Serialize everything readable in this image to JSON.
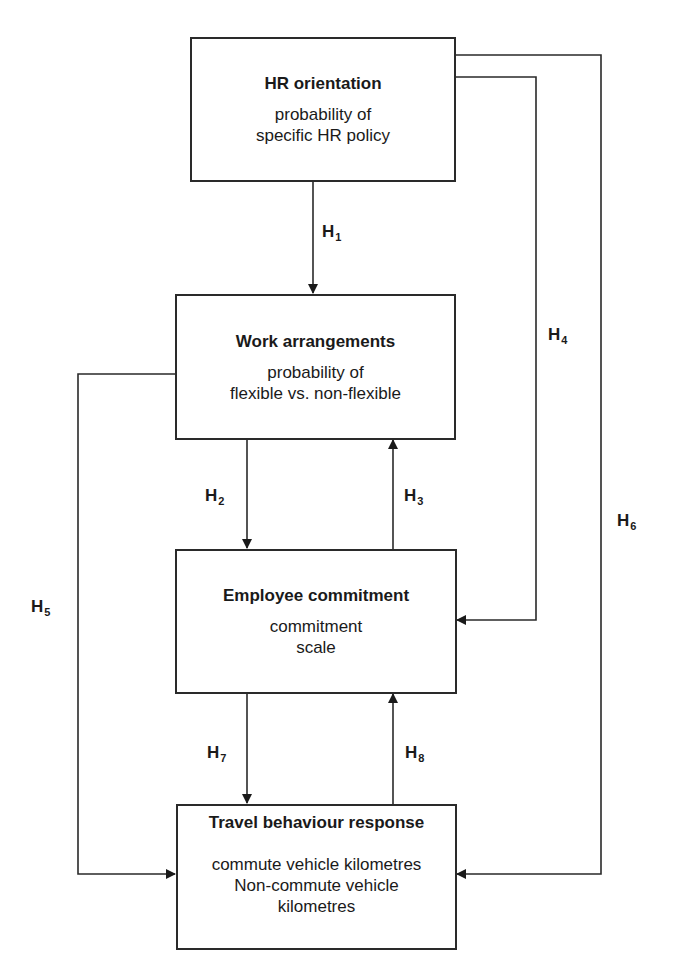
{
  "diagram": {
    "type": "flow-diagram",
    "line_color": "#2a2a2a",
    "boxes": [
      {
        "id": "hr",
        "title": "HR orientation",
        "desc": [
          "probability of",
          "specific HR policy"
        ]
      },
      {
        "id": "work",
        "title": "Work arrangements",
        "desc": [
          "probability of",
          "flexible vs. non-flexible"
        ]
      },
      {
        "id": "commit",
        "title": "Employee commitment",
        "desc": [
          "commitment",
          "scale"
        ]
      },
      {
        "id": "travel",
        "title": "Travel behaviour response",
        "desc": [
          "commute vehicle kilometres",
          "Non-commute vehicle",
          "kilometres"
        ]
      }
    ],
    "hypotheses": [
      {
        "base": "H",
        "sub": "1",
        "from": "HR orientation",
        "to": "Work arrangements"
      },
      {
        "base": "H",
        "sub": "2",
        "from": "Work arrangements",
        "to": "Employee commitment"
      },
      {
        "base": "H",
        "sub": "3",
        "from": "Employee commitment",
        "to": "Work arrangements"
      },
      {
        "base": "H",
        "sub": "4",
        "from": "HR orientation",
        "to": "Employee commitment"
      },
      {
        "base": "H",
        "sub": "5",
        "from": "Work arrangements",
        "to": "Travel behaviour response"
      },
      {
        "base": "H",
        "sub": "6",
        "from": "HR orientation",
        "to": "Travel behaviour response"
      },
      {
        "base": "H",
        "sub": "7",
        "from": "Employee commitment",
        "to": "Travel behaviour response"
      },
      {
        "base": "H",
        "sub": "8",
        "from": "Travel behaviour response",
        "to": "Employee commitment"
      }
    ]
  }
}
